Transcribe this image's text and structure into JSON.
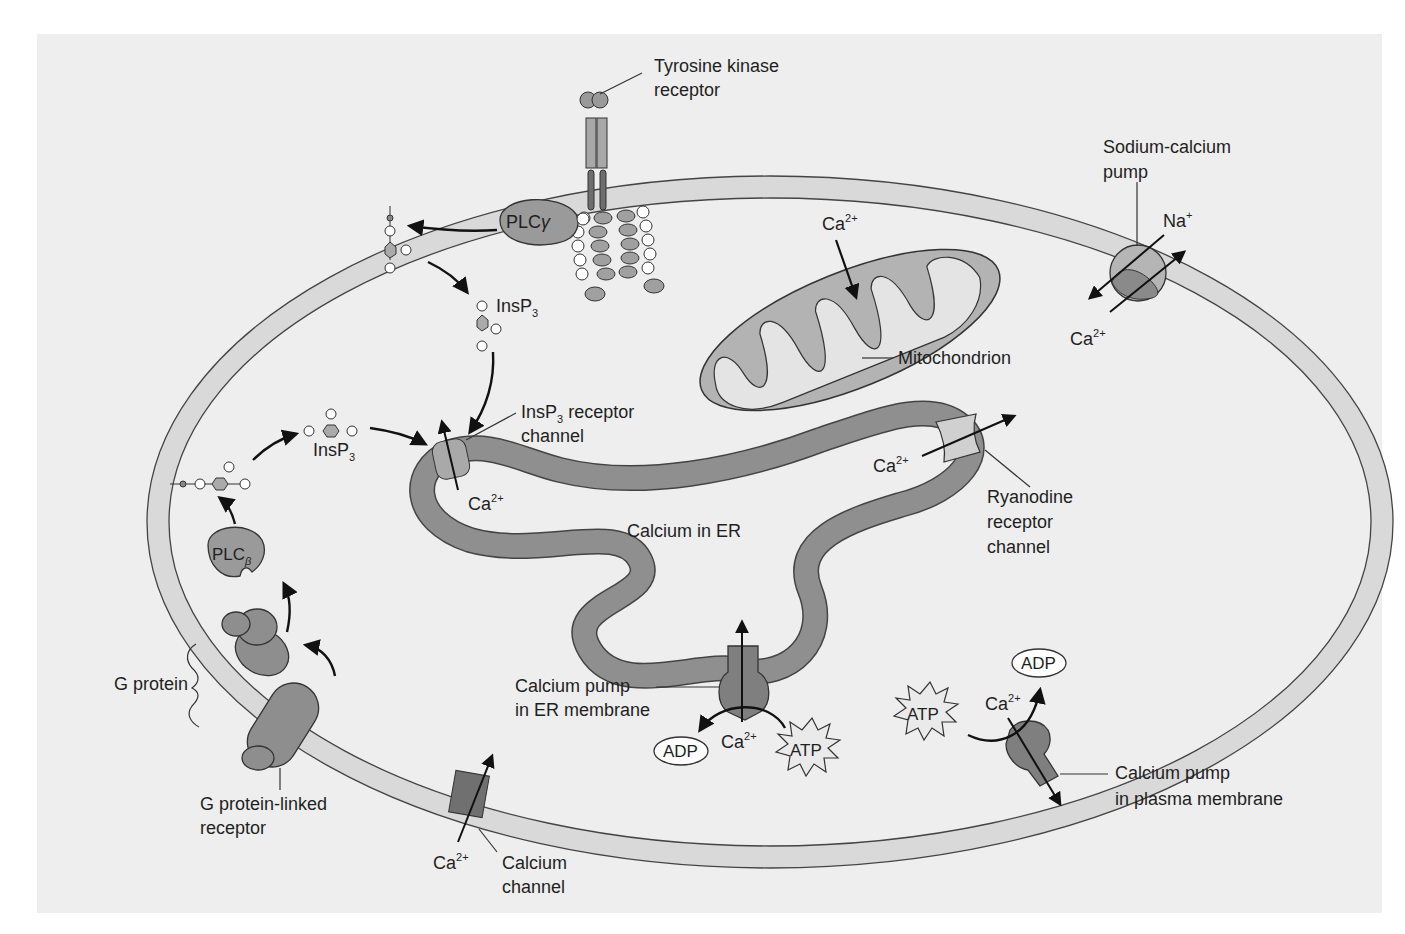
{
  "diagram": {
    "type": "cell calcium signaling schematic",
    "colors": {
      "background_panel": "#eeeeee",
      "membrane_fill": "#d9d9d9",
      "membrane_stroke": "#444444",
      "er_fill": "#8f8f8f",
      "protein_fill": "#9a9a9a",
      "protein_dark": "#7a7a7a",
      "light_circle": "#ffffff",
      "arrow": "#111111"
    },
    "labels": {
      "tyrosine_kinase_receptor": [
        "Tyrosine kinase",
        "receptor"
      ],
      "plc_gamma": "PLC",
      "plc_gamma_greek": "γ",
      "plc_beta": "PLC",
      "plc_beta_greek": "β",
      "insp3_top": "InsP",
      "insp3_top_sub": "3",
      "insp3_left": "InsP",
      "insp3_left_sub": "3",
      "insp3_receptor_channel_l1": "InsP",
      "insp3_receptor_channel_sub": "3",
      "insp3_receptor_channel_l1_rest": " receptor",
      "insp3_receptor_channel_l2": "channel",
      "ca_insp3_channel": "Ca",
      "calcium_in_er": "Calcium in ER",
      "ca_mito": "Ca",
      "mitochondrion": "Mitochondrion",
      "sodium_calcium_pump": [
        "Sodium-calcium",
        "pump"
      ],
      "na": "Na",
      "na_charge": "+",
      "ca_sodium_pump": "Ca",
      "ca_ryanodine": "Ca",
      "ryanodine_receptor_channel": [
        "Ryanodine",
        "receptor",
        "channel"
      ],
      "g_protein": "G protein",
      "g_protein_linked_receptor": [
        "G protein-linked",
        "receptor"
      ],
      "calcium_pump_er": [
        "Calcium pump",
        "in ER membrane"
      ],
      "adp_er": "ADP",
      "ca_er_pump": "Ca",
      "atp_er": "ATP",
      "atp_pm": "ATP",
      "ca_pm_pump": "Ca",
      "adp_pm": "ADP",
      "calcium_pump_pm": [
        "Calcium pump",
        "in plasma membrane"
      ],
      "ca_calcium_channel": "Ca",
      "calcium_channel": [
        "Calcium",
        "channel"
      ],
      "ca_charge": "2+"
    }
  }
}
